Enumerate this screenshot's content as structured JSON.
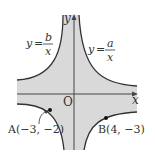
{
  "diagram": {
    "type": "hyperbola-graph",
    "axes": {
      "x_label": "x",
      "y_label": "y",
      "origin_label": "O"
    },
    "curves": [
      {
        "label_y": "y",
        "label_eq": "=",
        "numerator": "b",
        "denominator": "x",
        "id": "b-curve"
      },
      {
        "label_y": "y",
        "label_eq": "=",
        "numerator": "a",
        "denominator": "x",
        "id": "a-curve"
      }
    ],
    "points": [
      {
        "name": "A",
        "label": "A(−3, −2)",
        "x": -3,
        "y": -2
      },
      {
        "name": "B",
        "label": "B(4, −3)",
        "x": 4,
        "y": -3
      }
    ],
    "colors": {
      "shade": "#d9d9d9",
      "curve": "#333333",
      "axis": "#444444"
    }
  }
}
